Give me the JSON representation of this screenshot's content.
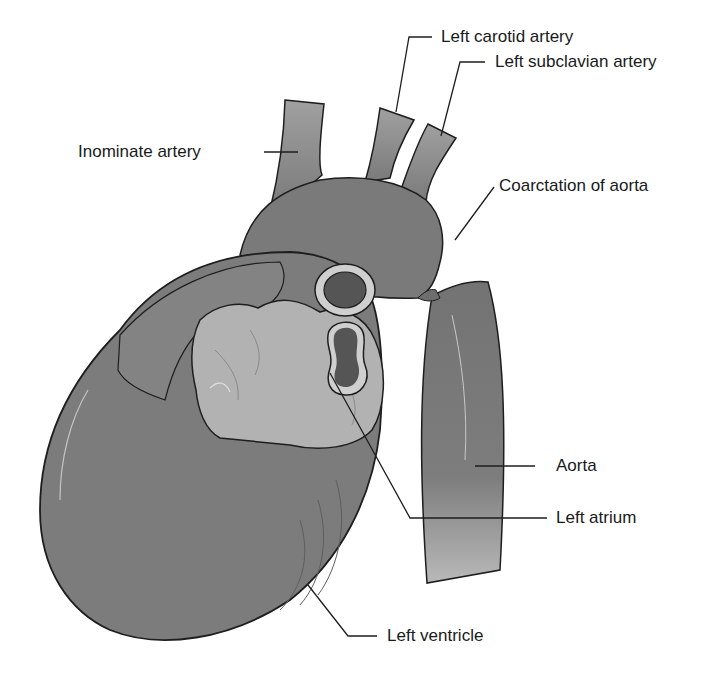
{
  "figure": {
    "type": "anatomical-illustration",
    "colors": {
      "tissue": "#7a7a7a",
      "tissue_light": "#a8a8a8",
      "atrium": "#b4b4b4",
      "lumen": "#555555",
      "outline": "#1e1e1e",
      "label_text": "#1a1a1a",
      "background": "#ffffff"
    }
  },
  "labels": {
    "left_carotid_artery": "Left carotid artery",
    "left_subclavian_artery": "Left subclavian artery",
    "inominate_artery": "Inominate artery",
    "coarctation_of_aorta": "Coarctation of aorta",
    "aorta": "Aorta",
    "left_atrium": "Left atrium",
    "left_ventricle": "Left ventricle"
  }
}
